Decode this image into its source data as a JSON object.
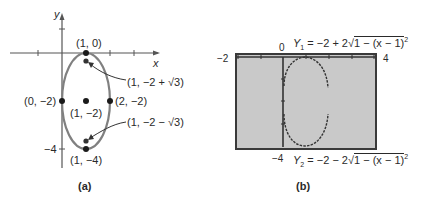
{
  "figure_a": {
    "caption": "(a)",
    "axis_labels": {
      "x": "x",
      "y": "y"
    },
    "y_tick_label": "−4",
    "points": [
      {
        "label": "(1, 0)",
        "x": 1,
        "y": 0
      },
      {
        "label": "(1, −2 + √3)",
        "x": 1,
        "y": -0.268
      },
      {
        "label": "(0, −2)",
        "x": 0,
        "y": -2
      },
      {
        "label": "(1, −2)",
        "x": 1,
        "y": -2
      },
      {
        "label": "(2, −2)",
        "x": 2,
        "y": -2
      },
      {
        "label": "(1, −2 − √3)",
        "x": 1,
        "y": -3.732
      },
      {
        "label": "(1, −4)",
        "x": 1,
        "y": -4
      }
    ],
    "ellipse": {
      "center": [
        1,
        -2
      ],
      "semi_x": 1,
      "semi_y": 2
    },
    "colors": {
      "ellipse": "#808080",
      "points": "#1a1a1a"
    }
  },
  "figure_b": {
    "caption": "(b)",
    "window": {
      "xmin": "−2",
      "xmax": "4",
      "ymin": "−4",
      "ymax": "0"
    },
    "y1": {
      "name": "Y",
      "sub": "1",
      "rhs_prefix": "= −2 + 2",
      "radicand": "1 − (x − 1)",
      "power": "2"
    },
    "y2": {
      "name": "Y",
      "sub": "2",
      "rhs_prefix": "= −2 − 2",
      "radicand": "1 − (x − 1)",
      "power": "2"
    },
    "colors": {
      "screen": "#c9c9c9",
      "frame": "#3a3a3a",
      "curve": "#333333"
    }
  }
}
